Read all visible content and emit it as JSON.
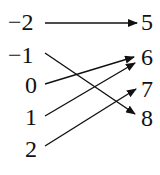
{
  "domain": "mapping-diagram",
  "domain_values": [
    "−2",
    "−1",
    "0",
    "1",
    "2"
  ],
  "range_values": [
    "5",
    "6",
    "7",
    "8"
  ],
  "mappings": [
    {
      "from": "−2",
      "to": "5"
    },
    {
      "from": "−1",
      "to": "8"
    },
    {
      "from": "0",
      "to": "6"
    },
    {
      "from": "1",
      "to": "6"
    },
    {
      "from": "2",
      "to": "7"
    }
  ]
}
